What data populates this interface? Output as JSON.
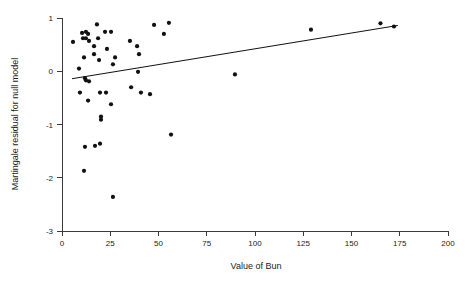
{
  "chart_data": {
    "type": "scatter",
    "title": "",
    "subtitle": "",
    "xlabel": "Value of Bun",
    "ylabel": "Martingale residual for null model",
    "xlim": [
      0,
      200
    ],
    "ylim": [
      -3,
      1
    ],
    "xticks": [
      0,
      25,
      50,
      75,
      100,
      125,
      150,
      175,
      200
    ],
    "xtick_labels": [
      "0",
      "25",
      "50",
      "75",
      "100",
      "125",
      "150",
      "175",
      "200"
    ],
    "yticks": [
      1,
      0,
      -1,
      -2,
      -3
    ],
    "ytick_labels": [
      "1",
      "0",
      "-1",
      "-2",
      "-3"
    ],
    "grid": false,
    "legend": null,
    "marker": "filled-circle",
    "marker_color": "#111111",
    "marker_size": 2.1,
    "points": [
      {
        "x": 5.7,
        "y": 0.55
      },
      {
        "x": 10.4,
        "y": 0.72
      },
      {
        "x": 12.4,
        "y": 0.74
      },
      {
        "x": 13.5,
        "y": 0.7
      },
      {
        "x": 10.9,
        "y": 0.62
      },
      {
        "x": 12.4,
        "y": 0.62
      },
      {
        "x": 14.0,
        "y": 0.57
      },
      {
        "x": 18.1,
        "y": 0.88
      },
      {
        "x": 22.3,
        "y": 0.74
      },
      {
        "x": 25.4,
        "y": 0.74
      },
      {
        "x": 18.7,
        "y": 0.62
      },
      {
        "x": 16.6,
        "y": 0.47
      },
      {
        "x": 23.3,
        "y": 0.42
      },
      {
        "x": 11.4,
        "y": 0.26
      },
      {
        "x": 16.6,
        "y": 0.32
      },
      {
        "x": 19.2,
        "y": 0.21
      },
      {
        "x": 26.4,
        "y": 0.13
      },
      {
        "x": 35.2,
        "y": 0.57
      },
      {
        "x": 38.9,
        "y": 0.47
      },
      {
        "x": 39.9,
        "y": 0.32
      },
      {
        "x": 27.5,
        "y": 0.26
      },
      {
        "x": 8.8,
        "y": 0.05
      },
      {
        "x": 11.9,
        "y": -0.13
      },
      {
        "x": 12.4,
        "y": -0.17
      },
      {
        "x": 14.0,
        "y": -0.19
      },
      {
        "x": 9.3,
        "y": -0.4
      },
      {
        "x": 13.5,
        "y": -0.55
      },
      {
        "x": 19.7,
        "y": -0.4
      },
      {
        "x": 22.8,
        "y": -0.4
      },
      {
        "x": 20.2,
        "y": -0.85
      },
      {
        "x": 20.2,
        "y": -0.91
      },
      {
        "x": 25.4,
        "y": -0.62
      },
      {
        "x": 35.8,
        "y": -0.3
      },
      {
        "x": 39.4,
        "y": -0.01
      },
      {
        "x": 40.9,
        "y": -0.4
      },
      {
        "x": 45.6,
        "y": -0.43
      },
      {
        "x": 47.7,
        "y": 0.87
      },
      {
        "x": 52.8,
        "y": 0.7
      },
      {
        "x": 55.4,
        "y": 0.91
      },
      {
        "x": 56.5,
        "y": -1.19
      },
      {
        "x": 11.9,
        "y": -1.42
      },
      {
        "x": 17.1,
        "y": -1.4
      },
      {
        "x": 19.7,
        "y": -1.36
      },
      {
        "x": 11.4,
        "y": -1.87
      },
      {
        "x": 26.4,
        "y": -2.36
      },
      {
        "x": 89.6,
        "y": -0.06
      },
      {
        "x": 129.0,
        "y": 0.78
      },
      {
        "x": 165.0,
        "y": 0.9
      },
      {
        "x": 172.0,
        "y": 0.84
      }
    ],
    "fit_line": {
      "label": "",
      "color": "#111111",
      "x0": 5.2,
      "y0": -0.14,
      "x1": 174.0,
      "y1": 0.86
    }
  },
  "axes": {
    "x_axis_name": "x-axis",
    "y_axis_name": "y-axis"
  }
}
